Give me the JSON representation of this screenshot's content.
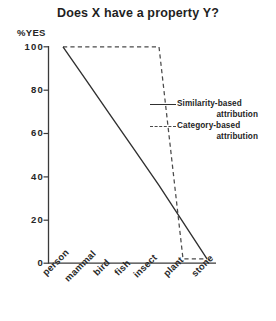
{
  "chart_data": {
    "type": "line",
    "title": "Does X have a property Y?",
    "xlabel": "",
    "ylabel": "%YES",
    "categories": [
      "person",
      "mammal",
      "bird",
      "fish",
      "insect",
      "plant",
      "stone"
    ],
    "ylim": [
      0,
      100
    ],
    "yticks": [
      100,
      80,
      60,
      40,
      20,
      0
    ],
    "ytick_labels": [
      "100",
      "80",
      "60",
      "40",
      "20",
      "0"
    ],
    "grid": false,
    "legend_position": "center-right",
    "series": [
      {
        "name": "Similarity-based attribution",
        "style": "solid",
        "values": [
          100,
          84,
          68,
          52,
          36,
          19,
          2
        ]
      },
      {
        "name": "Category-based attribution",
        "style": "dashed",
        "values": [
          100,
          100,
          100,
          100,
          100,
          2,
          2
        ]
      }
    ]
  },
  "legend": {
    "entries": [
      {
        "line1": "Similarity-based",
        "line2": "attribution",
        "style": "solid"
      },
      {
        "line1": "Category-based",
        "line2": "attribution",
        "style": "dashed"
      }
    ]
  },
  "colors": {
    "solid_line": "#303030",
    "dashed_line": "#4a4a4a",
    "axis": "#3a3a3a",
    "text": "#242424",
    "background": "#ffffff"
  }
}
